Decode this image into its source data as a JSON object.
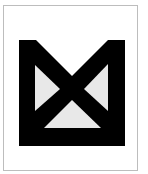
{
  "image": {
    "description": "Black geometric logo mark on white card",
    "icon": "bowtie-frame-logo-icon",
    "colors": {
      "mark": "#000000",
      "inner_triangles": "#e8e8e8",
      "background": "#ffffff",
      "border": "#bdbdbd"
    }
  }
}
